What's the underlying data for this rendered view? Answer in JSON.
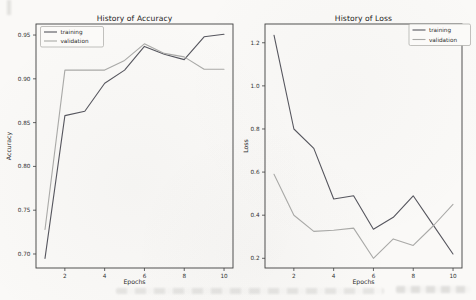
{
  "chart_data": [
    {
      "type": "line",
      "title": "History of Accuracy",
      "xlabel": "Epochs",
      "ylabel": "Accuracy",
      "x": [
        1,
        2,
        3,
        4,
        5,
        6,
        7,
        8,
        9,
        10
      ],
      "xlim": [
        0.55,
        10.45
      ],
      "ylim": [
        0.684,
        0.9626
      ],
      "xticks": [
        {
          "value": 2,
          "label": "2"
        },
        {
          "value": 4,
          "label": "4"
        },
        {
          "value": 6,
          "label": "6"
        },
        {
          "value": 8,
          "label": "8"
        },
        {
          "value": 10,
          "label": "10"
        }
      ],
      "yticks": [
        {
          "value": 0.95,
          "label": "0.95"
        },
        {
          "value": 0.9,
          "label": "0.90"
        },
        {
          "value": 0.85,
          "label": "0.85"
        },
        {
          "value": 0.8,
          "label": "0.80"
        },
        {
          "value": 0.75,
          "label": "0.75"
        },
        {
          "value": 0.7,
          "label": "0.70"
        }
      ],
      "legend_position": "upper-left",
      "grid": false,
      "series": [
        {
          "name": "training",
          "color": "#56565e",
          "values": [
            0.695,
            0.858,
            0.863,
            0.895,
            0.91,
            0.937,
            0.928,
            0.922,
            0.948,
            0.951
          ]
        },
        {
          "name": "validation",
          "color": "#a9a9a7",
          "values": [
            0.728,
            0.91,
            0.91,
            0.91,
            0.921,
            0.94,
            0.929,
            0.925,
            0.911,
            0.911
          ]
        }
      ]
    },
    {
      "type": "line",
      "title": "History of Loss",
      "xlabel": "Epochs",
      "ylabel": "Loss",
      "x": [
        1,
        2,
        3,
        4,
        5,
        6,
        7,
        8,
        9,
        10
      ],
      "xlim": [
        0.55,
        10.45
      ],
      "ylim": [
        0.155,
        1.287
      ],
      "xticks": [
        {
          "value": 2,
          "label": "2"
        },
        {
          "value": 4,
          "label": "4"
        },
        {
          "value": 6,
          "label": "6"
        },
        {
          "value": 8,
          "label": "8"
        },
        {
          "value": 10,
          "label": "10"
        }
      ],
      "yticks": [
        {
          "value": 1.2,
          "label": "1.2"
        },
        {
          "value": 1.0,
          "label": "1.0"
        },
        {
          "value": 0.8,
          "label": "0.8"
        },
        {
          "value": 0.6,
          "label": "0.6"
        },
        {
          "value": 0.4,
          "label": "0.4"
        },
        {
          "value": 0.2,
          "label": "0.2"
        }
      ],
      "legend_position": "upper-right",
      "grid": false,
      "series": [
        {
          "name": "training",
          "color": "#56565e",
          "values": [
            1.235,
            0.8,
            0.71,
            0.475,
            0.49,
            0.335,
            0.39,
            0.49,
            0.355,
            0.22
          ]
        },
        {
          "name": "validation",
          "color": "#a9a9a7",
          "values": [
            0.59,
            0.4,
            0.325,
            0.33,
            0.34,
            0.2,
            0.29,
            0.26,
            0.35,
            0.45
          ]
        }
      ]
    }
  ]
}
